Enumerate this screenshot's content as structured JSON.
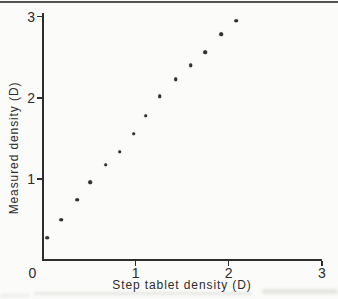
{
  "chart_data": {
    "type": "scatter",
    "title": "",
    "xlabel": "Step tablet density (D)",
    "ylabel": "Measured density (D)",
    "xlim": [
      0,
      3
    ],
    "ylim": [
      0,
      3
    ],
    "grid": false,
    "legend": "none",
    "x_ticks": [
      {
        "value": 0,
        "label": "0",
        "tick": false
      },
      {
        "value": 1,
        "label": "1",
        "tick": true
      },
      {
        "value": 2,
        "label": "2",
        "tick": true
      },
      {
        "value": 3,
        "label": "3",
        "tick": true
      }
    ],
    "y_ticks": [
      {
        "value": 1,
        "label": "1",
        "tick": true
      },
      {
        "value": 2,
        "label": "2",
        "tick": true
      },
      {
        "value": 3,
        "label": "3",
        "tick": true
      }
    ],
    "points": [
      [
        0.05,
        0.28
      ],
      [
        0.2,
        0.5
      ],
      [
        0.37,
        0.75
      ],
      [
        0.51,
        0.96
      ],
      [
        0.68,
        1.18
      ],
      [
        0.83,
        1.34
      ],
      [
        0.98,
        1.56
      ],
      [
        1.11,
        1.78
      ],
      [
        1.26,
        2.02
      ],
      [
        1.43,
        2.23
      ],
      [
        1.59,
        2.4
      ],
      [
        1.75,
        2.56
      ],
      [
        1.92,
        2.78
      ],
      [
        2.08,
        2.95
      ]
    ],
    "colors": {
      "ink": "#2e2e2e",
      "paper": "#fbfbf9"
    }
  }
}
